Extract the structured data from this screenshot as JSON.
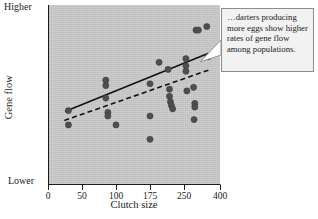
{
  "figure": {
    "kind": "scatter-plot-with-callout",
    "background_color": "#ffffff",
    "plot_background_color": "#c9c9c9",
    "point_color": "#4e4e4e",
    "line_color": "#111111"
  },
  "callout": {
    "text": "…darters producing more eggs show higher rates of gene flow among populations.",
    "border_color": "#8d8d8d",
    "fill_color": "#f2f2f2"
  },
  "axes": {
    "x_title": "Clutch size",
    "y_title": "Gene flow",
    "y_high_label": "Higher",
    "y_low_label": "Lower"
  },
  "chart_data": {
    "type": "scatter",
    "title": "",
    "xlabel": "Clutch size",
    "ylabel": "Gene flow",
    "xlim": [
      0,
      400
    ],
    "ylim": [
      0,
      100
    ],
    "grid": false,
    "legend": "none",
    "x_tick_labels": [
      "0",
      "50",
      "100",
      "175",
      "250",
      "400"
    ],
    "x_tick_values": [
      0,
      50,
      100,
      175,
      250,
      400
    ],
    "y_tick_labels": [
      "Lower",
      "Higher"
    ],
    "y_tick_values": [
      0,
      100
    ],
    "y_axis_note": "Ordinal axis: only Lower and Higher are marked; no numeric ticks.",
    "x_axis_note": "Tick spacing is non-uniform as drawn; 0,50,100,175,250 are evenly spaced and 400 sits at the right edge.",
    "points": [
      {
        "x": 30,
        "y": 41
      },
      {
        "x": 30,
        "y": 33
      },
      {
        "x": 85,
        "y": 58
      },
      {
        "x": 85,
        "y": 55
      },
      {
        "x": 85,
        "y": 48
      },
      {
        "x": 88,
        "y": 40
      },
      {
        "x": 88,
        "y": 38
      },
      {
        "x": 100,
        "y": 33
      },
      {
        "x": 175,
        "y": 56
      },
      {
        "x": 175,
        "y": 38
      },
      {
        "x": 175,
        "y": 25
      },
      {
        "x": 195,
        "y": 68
      },
      {
        "x": 215,
        "y": 64
      },
      {
        "x": 218,
        "y": 53
      },
      {
        "x": 218,
        "y": 49
      },
      {
        "x": 220,
        "y": 46
      },
      {
        "x": 222,
        "y": 44
      },
      {
        "x": 225,
        "y": 42
      },
      {
        "x": 258,
        "y": 70
      },
      {
        "x": 258,
        "y": 66
      },
      {
        "x": 258,
        "y": 63
      },
      {
        "x": 262,
        "y": 52
      },
      {
        "x": 290,
        "y": 54
      },
      {
        "x": 295,
        "y": 45
      },
      {
        "x": 295,
        "y": 43
      },
      {
        "x": 292,
        "y": 36
      },
      {
        "x": 300,
        "y": 86
      },
      {
        "x": 310,
        "y": 86
      },
      {
        "x": 345,
        "y": 88
      },
      {
        "x": 350,
        "y": 71
      }
    ],
    "series": [
      {
        "name": "solid regression line",
        "style": "solid",
        "x": [
          25,
          352
        ],
        "y": [
          40.5,
          73.0
        ]
      },
      {
        "name": "dashed regression line",
        "style": "dashed",
        "x": [
          24,
          360
        ],
        "y": [
          35.5,
          64.0
        ]
      }
    ]
  }
}
